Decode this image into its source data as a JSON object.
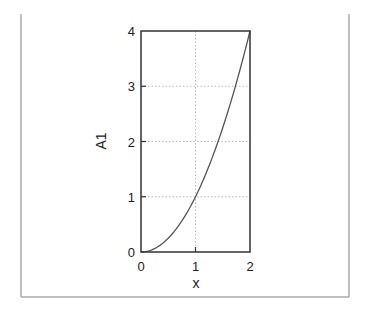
{
  "chart_data": {
    "type": "line",
    "title": "",
    "xlabel": "x",
    "ylabel": "A1",
    "xlim": [
      0,
      2
    ],
    "ylim": [
      0,
      4
    ],
    "xticks": [
      0,
      1,
      2
    ],
    "yticks": [
      0,
      1,
      2,
      3,
      4
    ],
    "xtick_labels": [
      "0",
      "1",
      "2"
    ],
    "ytick_labels": [
      "0",
      "1",
      "2",
      "3",
      "4"
    ],
    "grid": true,
    "grid_style": "dotted",
    "legend": null,
    "series": [
      {
        "name": "A1",
        "function": "x^2",
        "x": [
          0,
          0.25,
          0.5,
          0.75,
          1.0,
          1.25,
          1.5,
          1.75,
          2.0
        ],
        "y": [
          0,
          0.0625,
          0.25,
          0.5625,
          1.0,
          1.5625,
          2.25,
          3.0625,
          4.0
        ],
        "color": "#555555"
      }
    ]
  },
  "colors": {
    "frame": "#aaaaaa",
    "plot_box": "#333333",
    "grid": "#bbbbbb",
    "curve": "#555555",
    "text": "#222222"
  }
}
